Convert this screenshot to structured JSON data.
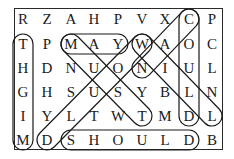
{
  "puzzle": {
    "type": "word-search",
    "rows": 6,
    "cols": 9,
    "grid": [
      [
        "R",
        "Z",
        "A",
        "H",
        "P",
        "V",
        "X",
        "C",
        "P"
      ],
      [
        "T",
        "P",
        "M",
        "A",
        "Y",
        "W",
        "A",
        "O",
        "C"
      ],
      [
        "H",
        "D",
        "N",
        "U",
        "O",
        "N",
        "I",
        "U",
        "L"
      ],
      [
        "G",
        "H",
        "S",
        "U",
        "S",
        "Y",
        "B",
        "L",
        "N"
      ],
      [
        "I",
        "Y",
        "L",
        "T",
        "W",
        "T",
        "M",
        "D",
        "L"
      ],
      [
        "M",
        "D",
        "S",
        "H",
        "O",
        "U",
        "L",
        "D",
        "B"
      ]
    ],
    "found_words": [
      {
        "word": "MIGHT",
        "start": [
          5,
          0
        ],
        "end": [
          1,
          0
        ],
        "direction": "up"
      },
      {
        "word": "MAY",
        "start": [
          1,
          2
        ],
        "end": [
          1,
          4
        ],
        "direction": "right"
      },
      {
        "word": "COULD",
        "start": [
          0,
          7
        ],
        "end": [
          4,
          7
        ],
        "direction": "down"
      },
      {
        "word": "SHOULD",
        "start": [
          5,
          2
        ],
        "end": [
          5,
          7
        ],
        "direction": "right"
      },
      {
        "word": "MUST",
        "start": [
          1,
          2
        ],
        "end": [
          4,
          5
        ],
        "direction": "down-right"
      },
      {
        "word": "WILL",
        "start": [
          1,
          5
        ],
        "end": [
          4,
          8
        ],
        "direction": "down-right"
      },
      {
        "word": "WOULD",
        "start": [
          1,
          5
        ],
        "end": [
          5,
          1
        ],
        "direction": "down-left"
      },
      {
        "word": "CAN",
        "start": [
          0,
          7
        ],
        "end": [
          2,
          5
        ],
        "direction": "down-left"
      }
    ],
    "colors": {
      "ink": "#1a1a1a",
      "background": "#ffffff"
    }
  }
}
